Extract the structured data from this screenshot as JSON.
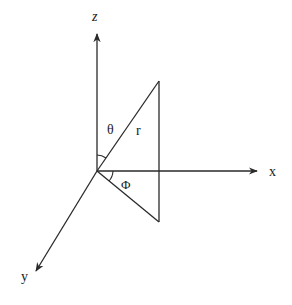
{
  "diagram": {
    "stroke_color": "#2a2a2a",
    "background": "#ffffff",
    "origin": [
      97,
      171
    ],
    "axes": [
      {
        "name": "z",
        "label": "z",
        "from": [
          97,
          171
        ],
        "to": [
          97,
          32
        ],
        "label_pos": [
          94,
          20
        ]
      },
      {
        "name": "x",
        "label": "x",
        "from": [
          97,
          171
        ],
        "to": [
          258,
          171
        ],
        "label_pos": [
          271,
          176
        ]
      },
      {
        "name": "y",
        "label": "y",
        "from": [
          97,
          171
        ],
        "to": [
          35,
          272
        ],
        "label_pos": [
          23,
          281
        ]
      }
    ],
    "vector_r": {
      "label": "r",
      "from": [
        97,
        171
      ],
      "to": [
        159,
        81
      ],
      "label_pos": [
        138,
        114
      ]
    },
    "projection": {
      "vertical_line": {
        "from": [
          159,
          81
        ],
        "to": [
          159,
          222
        ]
      },
      "base_line": {
        "from": [
          97,
          171
        ],
        "to": [
          159,
          222
        ]
      }
    },
    "angles": [
      {
        "name": "theta",
        "label": "θ",
        "label_pos": [
          113,
          132
        ],
        "arc_between": [
          "z",
          "r"
        ]
      },
      {
        "name": "phi",
        "label": "Φ",
        "label_pos": [
          124,
          188
        ],
        "arc_between": [
          "x",
          "projection"
        ]
      }
    ]
  }
}
